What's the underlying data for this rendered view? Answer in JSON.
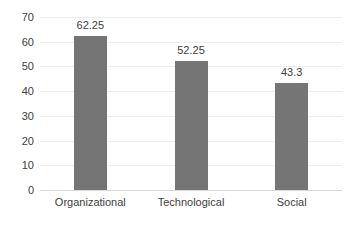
{
  "chart_data": {
    "type": "bar",
    "title": "",
    "subtitle": "",
    "xlabel": "",
    "ylabel": "",
    "categories": [
      "Organizational",
      "Technological",
      "Social"
    ],
    "values": [
      62.25,
      52.25,
      43.3
    ],
    "data_labels": [
      "62.25",
      "52.25",
      "43.3"
    ],
    "ylim": [
      0,
      70
    ],
    "ytick_labels": [
      "70",
      "60",
      "50",
      "40",
      "30",
      "20",
      "10",
      "0"
    ],
    "ytick_values": [
      70,
      60,
      50,
      40,
      30,
      20,
      10,
      0
    ],
    "grid": true,
    "legend": false,
    "legend_position": "none",
    "colors": {
      "bar": "#757575",
      "gridline": "#ededed",
      "baseline": "#d9d9d9",
      "text": "#404040",
      "background": "#ffffff"
    }
  }
}
